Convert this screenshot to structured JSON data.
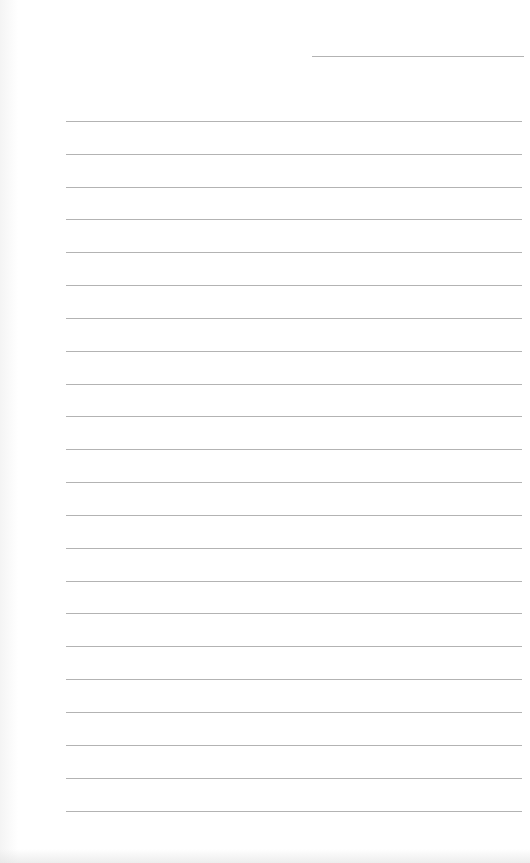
{
  "document": {
    "type": "lined-paper",
    "header_line": {
      "left": 312,
      "top": 56,
      "width": 212
    },
    "ruled_lines": {
      "left": 66,
      "width": 456,
      "tops": [
        121,
        154,
        187,
        219,
        252,
        285,
        318,
        351,
        384,
        416,
        449,
        482,
        515,
        548,
        581,
        613,
        646,
        679,
        712,
        745,
        778,
        811
      ]
    },
    "colors": {
      "line": "#9a9a9a",
      "paper": "#ffffff"
    }
  }
}
